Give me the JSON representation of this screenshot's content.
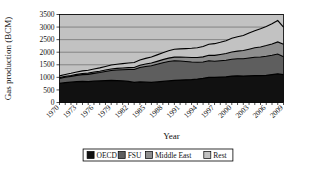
{
  "chart_data": {
    "type": "area",
    "stacked": true,
    "title": "",
    "xlabel": "Year",
    "ylabel": "Gas production (BCM)",
    "ylim": [
      0,
      3500
    ],
    "ytick_step": 500,
    "yticks": [
      0,
      500,
      1000,
      1500,
      2000,
      2500,
      3000,
      3500
    ],
    "grid": true,
    "legend_position": "bottom",
    "xlim": [
      1970,
      2009
    ],
    "x": [
      1970,
      1971,
      1972,
      1973,
      1974,
      1975,
      1976,
      1977,
      1978,
      1979,
      1980,
      1981,
      1982,
      1983,
      1984,
      1985,
      1986,
      1987,
      1988,
      1989,
      1990,
      1991,
      1992,
      1993,
      1994,
      1995,
      1996,
      1997,
      1998,
      1999,
      2000,
      2001,
      2002,
      2003,
      2004,
      2005,
      2006,
      2007,
      2008,
      2009
    ],
    "xtick_labels": [
      "1970",
      "1973",
      "1976",
      "1979",
      "1982",
      "1985",
      "1988",
      "1991",
      "1994",
      "1997",
      "2000",
      "2003",
      "2006",
      "2009"
    ],
    "xticks": [
      1970,
      1973,
      1976,
      1979,
      1982,
      1985,
      1988,
      1991,
      1994,
      1997,
      2000,
      2003,
      2006,
      2009
    ],
    "series": [
      {
        "name": "OECD",
        "color": "#111111",
        "values": [
          760,
          790,
          810,
          830,
          840,
          830,
          850,
          860,
          870,
          880,
          870,
          860,
          840,
          800,
          820,
          810,
          800,
          820,
          840,
          860,
          880,
          890,
          900,
          910,
          930,
          960,
          1000,
          1000,
          1010,
          1020,
          1050,
          1060,
          1050,
          1060,
          1070,
          1070,
          1080,
          1110,
          1140,
          1110
        ]
      },
      {
        "name": "FSU",
        "color": "#5e5e5e",
        "values": [
          200,
          215,
          230,
          250,
          270,
          290,
          310,
          330,
          360,
          390,
          420,
          440,
          470,
          510,
          570,
          620,
          660,
          700,
          740,
          770,
          780,
          760,
          730,
          700,
          670,
          650,
          660,
          640,
          650,
          660,
          670,
          680,
          690,
          710,
          730,
          740,
          760,
          770,
          790,
          710
        ]
      },
      {
        "name": "Middle East",
        "color": "#8e8e8e",
        "values": [
          30,
          33,
          36,
          40,
          44,
          48,
          52,
          56,
          60,
          65,
          68,
          72,
          78,
          84,
          92,
          100,
          108,
          116,
          126,
          136,
          146,
          156,
          168,
          180,
          192,
          205,
          220,
          235,
          250,
          268,
          288,
          305,
          325,
          350,
          375,
          400,
          425,
          450,
          480,
          500
        ]
      },
      {
        "name": "Rest",
        "color": "#c2c2c2",
        "values": [
          70,
          78,
          86,
          95,
          104,
          112,
          122,
          132,
          142,
          155,
          165,
          175,
          185,
          196,
          210,
          225,
          240,
          258,
          275,
          292,
          310,
          325,
          345,
          365,
          388,
          410,
          440,
          465,
          485,
          510,
          545,
          570,
          600,
          640,
          680,
          720,
          760,
          800,
          850,
          680
        ]
      }
    ],
    "totals_note": "stacked totals rise from about 1060 in 1970 to about 3000 in 2009"
  },
  "legend": {
    "items": [
      {
        "label": "OECD",
        "color": "#111111"
      },
      {
        "label": "FSU",
        "color": "#5e5e5e"
      },
      {
        "label": "Middle East",
        "color": "#8e8e8e"
      },
      {
        "label": "Rest",
        "color": "#c2c2c2"
      }
    ]
  },
  "colors": {
    "oecd": "#111111",
    "fsu": "#5e5e5e",
    "middle_east": "#8e8e8e",
    "rest": "#c2c2c2",
    "plot_background": "#c2c2c2",
    "axis": "#000000",
    "gridline": "#5a5a5a"
  }
}
